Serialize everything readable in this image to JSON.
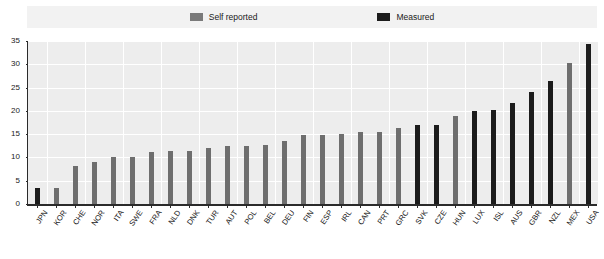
{
  "legend": {
    "entries": [
      {
        "label": "Self reported",
        "key": "self",
        "color": "#7a7a7a"
      },
      {
        "label": "Measured",
        "key": "meas",
        "color": "#1c1c1c"
      }
    ]
  },
  "axis": {
    "y_ticks": [
      "0",
      "5",
      "10",
      "15",
      "20",
      "25",
      "30",
      "35"
    ]
  },
  "chart_data": {
    "type": "bar",
    "title": "",
    "subtitle": "",
    "xlabel": "",
    "ylabel": "",
    "ylim": [
      0,
      35
    ],
    "ytick_step": 5,
    "grid": true,
    "legend_position": "top-center",
    "series": [
      {
        "name": "Self reported",
        "color": "#6e6e6e"
      },
      {
        "name": "Measured",
        "color": "#1c1c1c"
      }
    ],
    "categories": [
      "JPN",
      "KOR",
      "CHE",
      "NOR",
      "ITA",
      "SWE",
      "FRA",
      "NLD",
      "DNK",
      "TUR",
      "AUT",
      "POL",
      "BEL",
      "DEU",
      "FIN",
      "ESP",
      "IRL",
      "CAN",
      "PRT",
      "GRC",
      "SVK",
      "CZE",
      "HUN",
      "LUX",
      "ISL",
      "AUS",
      "GBR",
      "NZL",
      "MEX",
      "USA"
    ],
    "points": [
      {
        "category": "JPN",
        "value": 3.5,
        "series": "Measured"
      },
      {
        "category": "KOR",
        "value": 3.5,
        "series": "Self reported"
      },
      {
        "category": "CHE",
        "value": 8.1,
        "series": "Self reported"
      },
      {
        "category": "NOR",
        "value": 9.0,
        "series": "Self reported"
      },
      {
        "category": "ITA",
        "value": 10.0,
        "series": "Self reported"
      },
      {
        "category": "SWE",
        "value": 10.2,
        "series": "Self reported"
      },
      {
        "category": "FRA",
        "value": 11.2,
        "series": "Self reported"
      },
      {
        "category": "NLD",
        "value": 11.4,
        "series": "Self reported"
      },
      {
        "category": "DNK",
        "value": 11.4,
        "series": "Self reported"
      },
      {
        "category": "TUR",
        "value": 12.0,
        "series": "Self reported"
      },
      {
        "category": "AUT",
        "value": 12.4,
        "series": "Self reported"
      },
      {
        "category": "POL",
        "value": 12.5,
        "series": "Self reported"
      },
      {
        "category": "BEL",
        "value": 12.7,
        "series": "Self reported"
      },
      {
        "category": "DEU",
        "value": 13.6,
        "series": "Self reported"
      },
      {
        "category": "FIN",
        "value": 14.9,
        "series": "Self reported"
      },
      {
        "category": "ESP",
        "value": 14.9,
        "series": "Self reported"
      },
      {
        "category": "IRL",
        "value": 15.0,
        "series": "Self reported"
      },
      {
        "category": "CAN",
        "value": 15.4,
        "series": "Self reported"
      },
      {
        "category": "PRT",
        "value": 15.4,
        "series": "Self reported"
      },
      {
        "category": "GRC",
        "value": 16.4,
        "series": "Self reported"
      },
      {
        "category": "SVK",
        "value": 16.9,
        "series": "Measured"
      },
      {
        "category": "CZE",
        "value": 17.0,
        "series": "Measured"
      },
      {
        "category": "HUN",
        "value": 18.8,
        "series": "Self reported"
      },
      {
        "category": "LUX",
        "value": 20.0,
        "series": "Measured"
      },
      {
        "category": "ISL",
        "value": 20.1,
        "series": "Measured"
      },
      {
        "category": "AUS",
        "value": 21.7,
        "series": "Measured"
      },
      {
        "category": "GBR",
        "value": 24.0,
        "series": "Measured"
      },
      {
        "category": "NZL",
        "value": 26.5,
        "series": "Measured"
      },
      {
        "category": "MEX",
        "value": 30.2,
        "series": "Self reported"
      },
      {
        "category": "USA",
        "value": 34.4,
        "series": "Measured"
      }
    ]
  }
}
